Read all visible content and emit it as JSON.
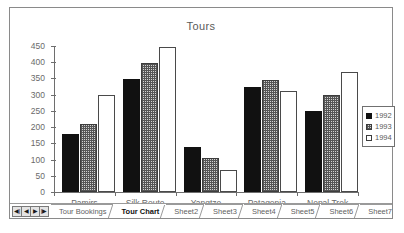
{
  "chart_data": {
    "type": "bar",
    "title": "Tours",
    "xlabel": "",
    "ylabel": "",
    "ylim": [
      0,
      450
    ],
    "yticks": [
      0,
      50,
      100,
      150,
      200,
      250,
      300,
      350,
      400,
      450
    ],
    "grid": false,
    "legend_position": "right",
    "categories": [
      "Pamirs",
      "Silk Route",
      "Yangtze",
      "Patagonia",
      "Nepal Trek"
    ],
    "series": [
      {
        "name": "1992",
        "color": "#111111",
        "fill": "solid",
        "values": [
          178,
          348,
          140,
          323,
          250
        ]
      },
      {
        "name": "1993",
        "color": "#d2d2d2",
        "fill": "hatched",
        "values": [
          210,
          398,
          105,
          345,
          298
        ]
      },
      {
        "name": "1994",
        "color": "#ffffff",
        "fill": "empty",
        "values": [
          298,
          448,
          67,
          312,
          370
        ]
      }
    ]
  },
  "chart": {
    "title": "Tours",
    "yticks": [
      "450",
      "400",
      "350",
      "300",
      "250",
      "200",
      "150",
      "100",
      "50",
      "0"
    ],
    "categories": [
      "Pamirs",
      "Silk Route",
      "Yangtze",
      "Patagonia",
      "Nepal Trek"
    ],
    "legend": {
      "entries": [
        {
          "label": "1992",
          "swatch": "solid-black-swatch"
        },
        {
          "label": "1993",
          "swatch": "hatched-gray-swatch"
        },
        {
          "label": "1994",
          "swatch": "empty-white-swatch"
        }
      ]
    }
  },
  "tab_bar": {
    "nav": [
      {
        "name": "first-sheet-button",
        "glyph": "◀|"
      },
      {
        "name": "previous-sheet-button",
        "glyph": "◀"
      },
      {
        "name": "next-sheet-button",
        "glyph": "▶"
      },
      {
        "name": "last-sheet-button",
        "glyph": "|▶"
      }
    ],
    "tabs": [
      {
        "label": "Tour Bookings",
        "active": false
      },
      {
        "label": "Tour Chart",
        "active": true
      },
      {
        "label": "Sheet2",
        "active": false
      },
      {
        "label": "Sheet3",
        "active": false
      },
      {
        "label": "Sheet4",
        "active": false
      },
      {
        "label": "Sheet5",
        "active": false
      },
      {
        "label": "Sheet6",
        "active": false
      },
      {
        "label": "Sheet7",
        "active": false
      },
      {
        "label": "Sheet8",
        "active": false
      },
      {
        "label": "Sheet",
        "active": false
      }
    ]
  }
}
